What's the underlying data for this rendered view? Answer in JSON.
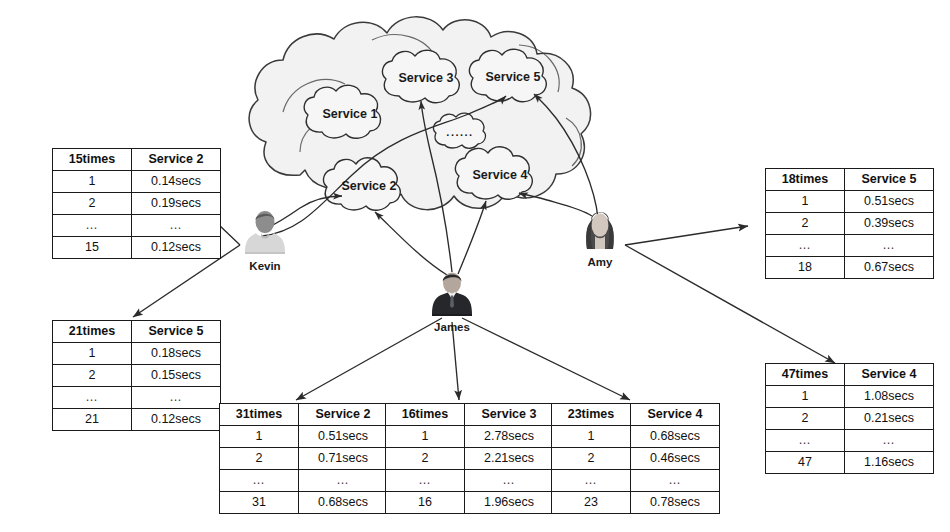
{
  "diagram": {
    "colors": {
      "line": "#2b2b2b",
      "cloud_fill": "#f0f0f0",
      "cloud_stroke": "#3a3a3a",
      "text": "#111111",
      "background": "#ffffff"
    }
  },
  "cloud": {
    "name": "service-cloud",
    "services": [
      {
        "id": "service-1",
        "label": "Service 1"
      },
      {
        "id": "service-2",
        "label": "Service 2"
      },
      {
        "id": "service-3",
        "label": "Service 3"
      },
      {
        "id": "service-4",
        "label": "Service 4"
      },
      {
        "id": "service-5",
        "label": "Service 5"
      },
      {
        "id": "service-more",
        "label": "......"
      }
    ]
  },
  "users": [
    {
      "id": "kevin",
      "name": "Kevin",
      "avatar": "male-casual-avatar"
    },
    {
      "id": "james",
      "name": "James",
      "avatar": "male-suit-avatar"
    },
    {
      "id": "amy",
      "name": "Amy",
      "avatar": "female-avatar"
    }
  ],
  "tables": [
    {
      "id": "kevin-service-2",
      "user": "Kevin",
      "header": {
        "count": "15times",
        "service": "Service 2"
      },
      "rows": [
        {
          "index": "1",
          "duration": "0.14secs"
        },
        {
          "index": "2",
          "duration": "0.19secs"
        },
        {
          "index": "…",
          "duration": "…"
        },
        {
          "index": "15",
          "duration": "0.12secs"
        }
      ]
    },
    {
      "id": "kevin-service-5",
      "user": "Kevin",
      "header": {
        "count": "21times",
        "service": "Service 5"
      },
      "rows": [
        {
          "index": "1",
          "duration": "0.18secs"
        },
        {
          "index": "2",
          "duration": "0.15secs"
        },
        {
          "index": "…",
          "duration": "…"
        },
        {
          "index": "21",
          "duration": "0.12secs"
        }
      ]
    },
    {
      "id": "james-service-2",
      "user": "James",
      "header": {
        "count": "31times",
        "service": "Service 2"
      },
      "rows": [
        {
          "index": "1",
          "duration": "0.51secs"
        },
        {
          "index": "2",
          "duration": "0.71secs"
        },
        {
          "index": "…",
          "duration": "…"
        },
        {
          "index": "31",
          "duration": "0.68secs"
        }
      ]
    },
    {
      "id": "james-service-3",
      "user": "James",
      "header": {
        "count": "16times",
        "service": "Service 3"
      },
      "rows": [
        {
          "index": "1",
          "duration": "2.78secs"
        },
        {
          "index": "2",
          "duration": "2.21secs"
        },
        {
          "index": "…",
          "duration": "…"
        },
        {
          "index": "16",
          "duration": "1.96secs"
        }
      ]
    },
    {
      "id": "james-service-4",
      "user": "James",
      "header": {
        "count": "23times",
        "service": "Service 4"
      },
      "rows": [
        {
          "index": "1",
          "duration": "0.68secs"
        },
        {
          "index": "2",
          "duration": "0.46secs"
        },
        {
          "index": "…",
          "duration": "…"
        },
        {
          "index": "23",
          "duration": "0.78secs"
        }
      ]
    },
    {
      "id": "amy-service-5",
      "user": "Amy",
      "header": {
        "count": "18times",
        "service": "Service 5"
      },
      "rows": [
        {
          "index": "1",
          "duration": "0.51secs"
        },
        {
          "index": "2",
          "duration": "0.39secs"
        },
        {
          "index": "…",
          "duration": "…"
        },
        {
          "index": "18",
          "duration": "0.67secs"
        }
      ]
    },
    {
      "id": "amy-service-4",
      "user": "Amy",
      "header": {
        "count": "47times",
        "service": "Service 4"
      },
      "rows": [
        {
          "index": "1",
          "duration": "1.08secs"
        },
        {
          "index": "2",
          "duration": "0.21secs"
        },
        {
          "index": "…",
          "duration": "…"
        },
        {
          "index": "47",
          "duration": "1.16secs"
        }
      ]
    }
  ]
}
